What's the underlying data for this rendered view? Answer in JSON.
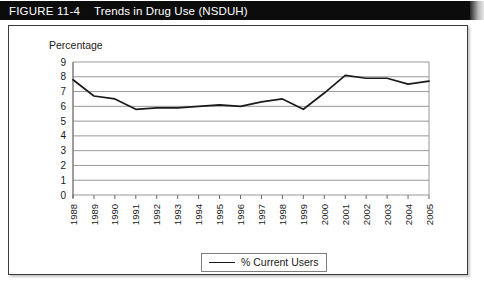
{
  "header": {
    "figure_number": "FIGURE 11-4",
    "title": "Trends in Drug Use (NSDUH)"
  },
  "legend": {
    "entries": [
      {
        "label": "% Current Users",
        "color": "#1b1b1b"
      }
    ]
  },
  "colors": {
    "header_background": "#0c0c0c",
    "header_text": "#ffffff",
    "panel_border": "#3b3b3b",
    "gridline": "#8d8d8d",
    "axis": "#6a6a6a",
    "series": "#1b1b1b",
    "page_background": "#ffffff"
  },
  "chart_data": {
    "type": "line",
    "title": "Trends in Drug Use (NSDUH)",
    "xlabel": "",
    "ylabel": "Percentage",
    "ylim": [
      0,
      9
    ],
    "yticks": [
      0,
      1,
      2,
      3,
      4,
      5,
      6,
      7,
      8,
      9
    ],
    "grid": true,
    "legend_position": "bottom-center",
    "x_tick_rotation": 90,
    "categories": [
      "1988",
      "1989",
      "1990",
      "1991",
      "1992",
      "1993",
      "1994",
      "1995",
      "1996",
      "1997",
      "1998",
      "1999",
      "2000",
      "2001",
      "2002",
      "2003",
      "2004",
      "2005"
    ],
    "series": [
      {
        "name": "% Current Users",
        "color": "#1b1b1b",
        "values": [
          7.8,
          6.7,
          6.5,
          5.8,
          5.9,
          5.9,
          6.0,
          6.1,
          6.0,
          6.3,
          6.5,
          5.8,
          6.9,
          8.1,
          7.9,
          7.9,
          7.5,
          7.7
        ]
      }
    ]
  }
}
